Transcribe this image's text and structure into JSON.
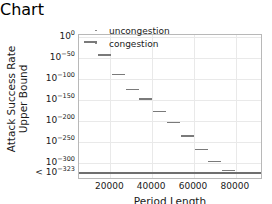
{
  "chart_data": {
    "type": "scatter",
    "title": "",
    "xlabel": "Period Length",
    "ylabel_line1": "Attack Success Rate",
    "ylabel_line2": "Upper Bound",
    "grid": true,
    "legend_position": "top-right",
    "xlim": [
      5000,
      93000
    ],
    "ylim_exponent": [
      -340,
      5
    ],
    "y_scale": "log",
    "y_floor_label": "< 10-323",
    "y_floor_exponent": -323,
    "x_ticks": [
      20000,
      40000,
      60000,
      80000
    ],
    "x_tick_labels": [
      "20000",
      "40000",
      "60000",
      "80000"
    ],
    "y_ticks_exponent": [
      0,
      -50,
      -100,
      -150,
      -200,
      -250,
      -300,
      -323
    ],
    "y_tick_labels": [
      "10^0",
      "10^-50",
      "10^-100",
      "10^-150",
      "10^-200",
      "10^-250",
      "10^-300",
      "< 10^-323"
    ],
    "series": [
      {
        "name": "uncongestion",
        "marker": "dash",
        "color": "#7a7a7a",
        "points": []
      },
      {
        "name": "congestion",
        "marker": "dash",
        "color": "#7a7a7a",
        "points": [
          {
            "x": 10500,
            "y_exponent": -12
          },
          {
            "x": 17200,
            "y_exponent": -43
          },
          {
            "x": 23800,
            "y_exponent": -89
          },
          {
            "x": 30400,
            "y_exponent": -125
          },
          {
            "x": 37000,
            "y_exponent": -147
          },
          {
            "x": 43600,
            "y_exponent": -177
          },
          {
            "x": 50200,
            "y_exponent": -203
          },
          {
            "x": 56800,
            "y_exponent": -236
          },
          {
            "x": 63400,
            "y_exponent": -267
          },
          {
            "x": 70000,
            "y_exponent": -296
          },
          {
            "x": 76600,
            "y_exponent": -317
          }
        ]
      }
    ],
    "floor_line": {
      "y_exponent": -323,
      "spans_full_width": true,
      "color": "#6f6f6f"
    }
  },
  "legend": {
    "entries": [
      {
        "label": "uncongestion"
      },
      {
        "label": "congestion"
      }
    ]
  },
  "axes": {
    "y_title_line1": "Attack Success Rate",
    "y_title_line2": "Upper Bound",
    "x_title": "Period Length"
  },
  "y_tick_display": [
    {
      "base": "10",
      "exp": "0"
    },
    {
      "base": "10",
      "exp": "−50"
    },
    {
      "base": "10",
      "exp": "−100"
    },
    {
      "base": "10",
      "exp": "−150"
    },
    {
      "base": "10",
      "exp": "−200"
    },
    {
      "base": "10",
      "exp": "−250"
    },
    {
      "base": "10",
      "exp": "−300"
    },
    {
      "base": "< 10",
      "exp": "−323"
    }
  ]
}
